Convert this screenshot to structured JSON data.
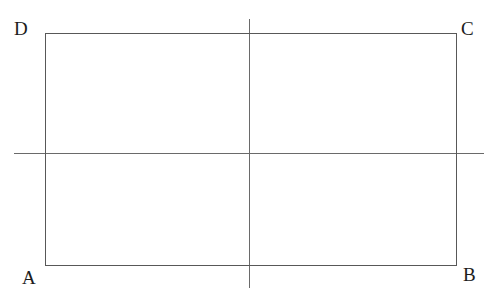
{
  "figure": {
    "background_color": "#ffffff",
    "stroke_color": "#585858",
    "axis_color": "#6a6a6a",
    "canvas": {
      "width": 495,
      "height": 302
    },
    "rectangle": {
      "name": "rectangle-abcd",
      "x": 45,
      "y": 33,
      "width": 412,
      "height": 233,
      "stroke_width": 1.6
    },
    "axes": [
      {
        "name": "vertical-midline",
        "orientation": "vertical",
        "x": 249,
        "y1": 19,
        "y2": 288,
        "stroke_width": 1.6
      },
      {
        "name": "horizontal-midline",
        "orientation": "horizontal",
        "y": 153,
        "x1": 14,
        "x2": 484,
        "stroke_width": 1.6
      }
    ],
    "vertex_labels": [
      {
        "id": "D",
        "text": "D",
        "corner": "top-left",
        "x": 14,
        "y": 19
      },
      {
        "id": "C",
        "text": "C",
        "corner": "top-right",
        "x": 461,
        "y": 19
      },
      {
        "id": "A",
        "text": "A",
        "corner": "bottom-left",
        "x": 22,
        "y": 268
      },
      {
        "id": "B",
        "text": "B",
        "corner": "bottom-right",
        "x": 463,
        "y": 265
      }
    ]
  }
}
